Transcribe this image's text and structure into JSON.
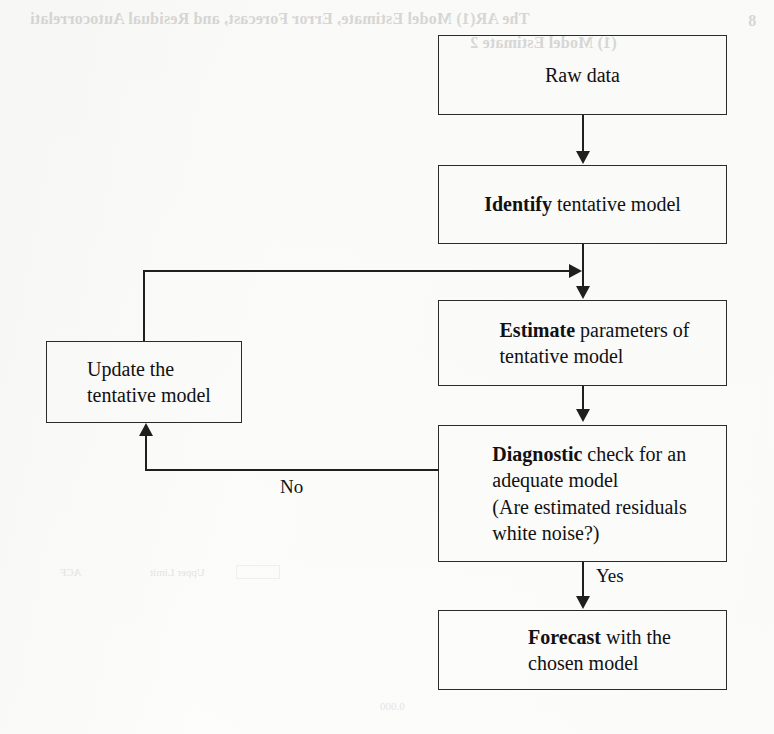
{
  "page": {
    "width": 774,
    "height": 734,
    "background_color": "#fdfdfc",
    "line_color": "#1f1f1f",
    "text_color": "#111111"
  },
  "flowchart": {
    "title_visible": false,
    "nodes": [
      {
        "id": "raw-data",
        "lines": [
          {
            "bold": "",
            "rest": "Raw data"
          }
        ],
        "align": "center"
      },
      {
        "id": "identify",
        "lines": [
          {
            "bold": "Identify",
            "rest": " tentative model"
          }
        ],
        "align": "center"
      },
      {
        "id": "estimate",
        "lines": [
          {
            "bold": "Estimate",
            "rest": " parameters of"
          },
          {
            "bold": "",
            "rest": "tentative model"
          }
        ],
        "align": "left"
      },
      {
        "id": "update",
        "lines": [
          {
            "bold": "",
            "rest": "Update the"
          },
          {
            "bold": "",
            "rest": "tentative model"
          }
        ],
        "align": "left"
      },
      {
        "id": "diagnostic",
        "lines": [
          {
            "bold": "Diagnostic",
            "rest": " check for an"
          },
          {
            "bold": "",
            "rest": "adequate model"
          },
          {
            "bold": "",
            "rest": "(Are estimated residuals"
          },
          {
            "bold": "",
            "rest": "white noise?)"
          }
        ],
        "align": "left"
      },
      {
        "id": "forecast",
        "lines": [
          {
            "bold": "Forecast",
            "rest": " with the"
          },
          {
            "bold": "",
            "rest": "chosen model"
          }
        ],
        "align": "left"
      }
    ],
    "edge_labels": {
      "no": "No",
      "yes": "Yes"
    }
  },
  "bleed_through": {
    "top_heading": "The AR(1) Model Estimate, Error Forecast,  and Residual Autocorrelati",
    "top_heading_2": "(1) Model Estimate 2",
    "top_margin_number": "8",
    "legend_acf": "ACF",
    "legend_upper": "Upper Limit",
    "footer": "0.000"
  }
}
